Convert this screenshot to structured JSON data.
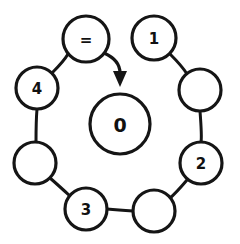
{
  "diagram": {
    "type": "ring-linked-structure",
    "title": "",
    "background_color": "#ffffff",
    "stroke_color": "#151515",
    "fill_color": "#ffffff",
    "center_node": {
      "id": "center",
      "label": "0",
      "cx": 120,
      "cy": 124,
      "r": 30
    },
    "ring_nodes": [
      {
        "id": "n-eq",
        "label": "=",
        "cx": 86,
        "cy": 39,
        "r": 23
      },
      {
        "id": "n-1",
        "label": "1",
        "cx": 154,
        "cy": 38,
        "r": 22
      },
      {
        "id": "n-blank1",
        "label": "",
        "cx": 200,
        "cy": 90,
        "r": 21
      },
      {
        "id": "n-2",
        "label": "2",
        "cx": 201,
        "cy": 163,
        "r": 21
      },
      {
        "id": "n-blank2",
        "label": "",
        "cx": 154,
        "cy": 211,
        "r": 21
      },
      {
        "id": "n-3",
        "label": "3",
        "cx": 86,
        "cy": 209,
        "r": 21
      },
      {
        "id": "n-blank3",
        "label": "",
        "cx": 35,
        "cy": 163,
        "r": 21
      },
      {
        "id": "n-4",
        "label": "4",
        "cx": 37,
        "cy": 88,
        "r": 21
      }
    ],
    "edges": [
      {
        "from": "n-4",
        "to": "n-eq",
        "path": "M 52 73 Q 64 61 68 54"
      },
      {
        "from": "n-1",
        "to": "n-blank1",
        "path": "M 170 54 Q 182 66 187 74"
      },
      {
        "from": "n-blank1",
        "to": "n-2",
        "path": "M 200 111 Q 202 137 201 142"
      },
      {
        "from": "n-2",
        "to": "n-blank2",
        "path": "M 187 180 Q 176 193 169 199"
      },
      {
        "from": "n-blank2",
        "to": "n-3",
        "path": "M 133 211 Q 118 210 107 209"
      },
      {
        "from": "n-3",
        "to": "n-blank3",
        "path": "M 70 196 Q 58 185 50 178"
      },
      {
        "from": "n-blank3",
        "to": "n-4",
        "path": "M 36 142 Q 36 121 37 109"
      }
    ],
    "arrow": {
      "id": "pointer-arrow",
      "from": "n-eq",
      "to": "center",
      "curve_path": "M 104 53 Q 120 60 120 73",
      "head_points": "113,71 127,71 120,87"
    }
  }
}
